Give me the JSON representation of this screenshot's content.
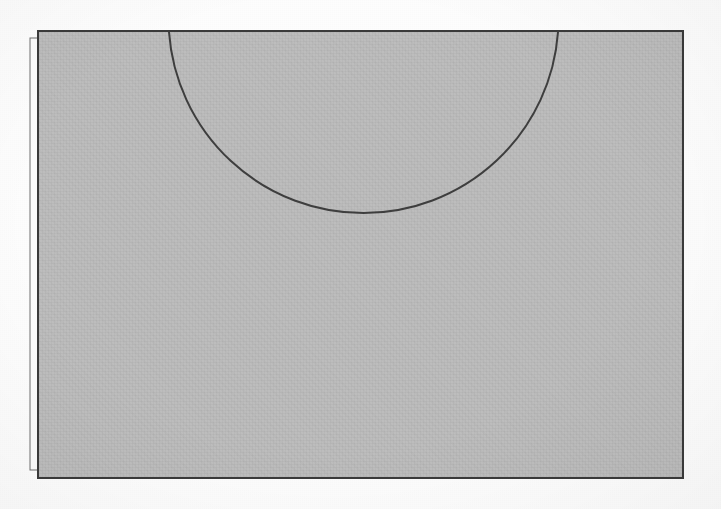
{
  "document": {
    "kind": "scanned-line-drawing",
    "media": "paper",
    "background_color": "#fdfdfd",
    "canvas": {
      "width": 721,
      "height": 509
    }
  },
  "figure": {
    "title": "",
    "caption": "",
    "colors": {
      "sheet_fill": "#bdbdbd",
      "back_sheet_fill": "#fbfbfb",
      "stroke": "#3a3a3a",
      "arc_stroke": "#3f3f3f",
      "page_background": "#fdfdfd"
    },
    "shapes": [
      {
        "name": "back-sheet",
        "type": "rect",
        "x": 30,
        "y": 38,
        "width": 651,
        "height": 432,
        "fill": "#fbfbfb",
        "stroke": "#6e6e6e",
        "stroke_width": 1
      },
      {
        "name": "main-sheet",
        "type": "rect",
        "x": 38,
        "y": 31,
        "width": 645,
        "height": 447,
        "fill": "#bdbdbd",
        "stroke": "#3a3a3a",
        "stroke_width": 2
      },
      {
        "name": "semicircular-arc",
        "type": "arc",
        "start_x": 169,
        "start_y": 32,
        "end_x": 558,
        "end_y": 32,
        "lowest_x": 363,
        "lowest_y": 222,
        "center_x": 363,
        "center_y": 31,
        "radius": 195,
        "sweep": "downward",
        "chord_length": 389,
        "sagitta": 191,
        "stroke": "#3f3f3f",
        "stroke_width": 2
      }
    ]
  }
}
